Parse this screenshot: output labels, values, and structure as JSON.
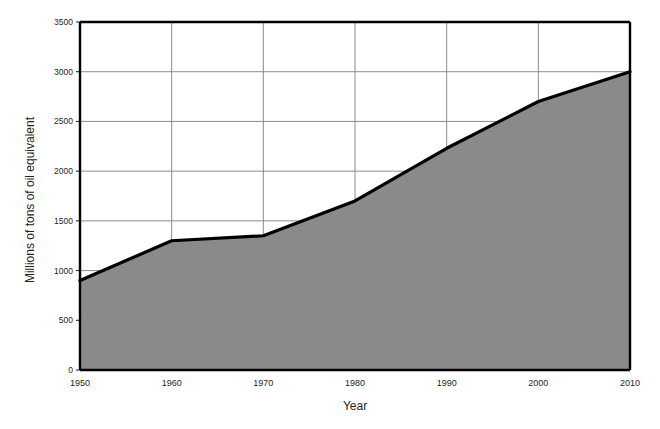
{
  "chart_data": {
    "type": "area",
    "title": "",
    "subtitle": "",
    "xlabel": "Year",
    "ylabel": "Millions of tons of oil equivalent",
    "x": [
      1950,
      1960,
      1970,
      1980,
      1990,
      2000,
      2010
    ],
    "values": [
      900,
      1300,
      1350,
      1700,
      2230,
      2700,
      3000
    ],
    "series": [
      {
        "name": "Millions of tons of oil equivalent",
        "values": [
          900,
          1300,
          1350,
          1700,
          2230,
          2700,
          3000
        ]
      }
    ],
    "xlim": [
      1950,
      2010
    ],
    "ylim": [
      0,
      3500
    ],
    "xticks": [
      1950,
      1960,
      1970,
      1980,
      1990,
      2000,
      2010
    ],
    "yticks": [
      0,
      500,
      1000,
      1500,
      2000,
      2500,
      3000,
      3500
    ],
    "xtick_labels": [
      "1950",
      "1960",
      "1970",
      "1980",
      "1990",
      "2000",
      "2010"
    ],
    "ytick_labels": [
      "0",
      "500",
      "1000",
      "1500",
      "2000",
      "2500",
      "3000",
      "3500"
    ],
    "grid": true,
    "grid_axis": "both",
    "legend": false,
    "legend_position": "none",
    "colors": {
      "area_fill": "#8a8a8a",
      "line": "#000000",
      "gridline": "#808080",
      "axis": "#000000",
      "background": "#ffffff",
      "text": "#231f20"
    }
  },
  "axis": {
    "y_title": "Millions of tons of oil equivalent",
    "x_title": "Year"
  }
}
